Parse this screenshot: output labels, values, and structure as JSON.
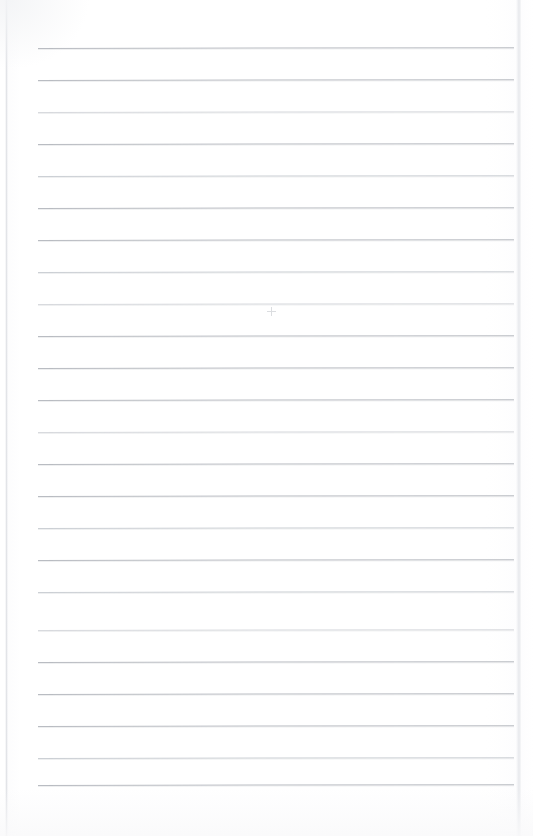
{
  "document": {
    "type": "scanned-lined-notebook-page",
    "title": "Blank lined notepad page",
    "content_text": "",
    "page_width_px": 533,
    "page_height_px": 836,
    "background_color": "#ffffff",
    "paper_color": "#fdfdfe"
  },
  "sheet": {
    "left_px": 6,
    "right_px": 519,
    "top_px": 0,
    "bottom_px": 836,
    "edge_color": "#d0d3d9"
  },
  "ruling": {
    "line_color": "#b9bcc2",
    "line_color_faint": "#ccd0d5",
    "line_color_extra_faint": "#d8dade",
    "line_count": 24,
    "line_left_px": 38,
    "line_right_px": 514,
    "line_width_px": 476,
    "line_thickness_px": 1,
    "first_line_y_px": 48,
    "spacing_px": 32,
    "skew_degrees": -0.1,
    "lines": [
      {
        "index": 1,
        "y": 48,
        "weight": "normal"
      },
      {
        "index": 2,
        "y": 80,
        "weight": "normal"
      },
      {
        "index": 3,
        "y": 112,
        "weight": "extra-faint"
      },
      {
        "index": 4,
        "y": 144,
        "weight": "normal"
      },
      {
        "index": 5,
        "y": 176,
        "weight": "faint"
      },
      {
        "index": 6,
        "y": 208,
        "weight": "normal"
      },
      {
        "index": 7,
        "y": 240,
        "weight": "normal"
      },
      {
        "index": 8,
        "y": 272,
        "weight": "faint"
      },
      {
        "index": 9,
        "y": 304,
        "weight": "extra-faint"
      },
      {
        "index": 10,
        "y": 336,
        "weight": "normal"
      },
      {
        "index": 11,
        "y": 368,
        "weight": "normal"
      },
      {
        "index": 12,
        "y": 400,
        "weight": "normal"
      },
      {
        "index": 13,
        "y": 432,
        "weight": "extra-faint"
      },
      {
        "index": 14,
        "y": 464,
        "weight": "normal"
      },
      {
        "index": 15,
        "y": 496,
        "weight": "normal"
      },
      {
        "index": 16,
        "y": 528,
        "weight": "faint"
      },
      {
        "index": 17,
        "y": 560,
        "weight": "normal"
      },
      {
        "index": 18,
        "y": 592,
        "weight": "faint"
      },
      {
        "index": 19,
        "y": 630,
        "weight": "extra-faint"
      },
      {
        "index": 20,
        "y": 662,
        "weight": "normal"
      },
      {
        "index": 21,
        "y": 694,
        "weight": "normal"
      },
      {
        "index": 22,
        "y": 726,
        "weight": "normal"
      },
      {
        "index": 23,
        "y": 758,
        "weight": "faint"
      },
      {
        "index": 24,
        "y": 785,
        "weight": "normal"
      }
    ]
  },
  "marks": [
    {
      "name": "pencil-dot",
      "x": 267,
      "y": 307,
      "description": "faint small pencil cross mark near page center"
    }
  ]
}
